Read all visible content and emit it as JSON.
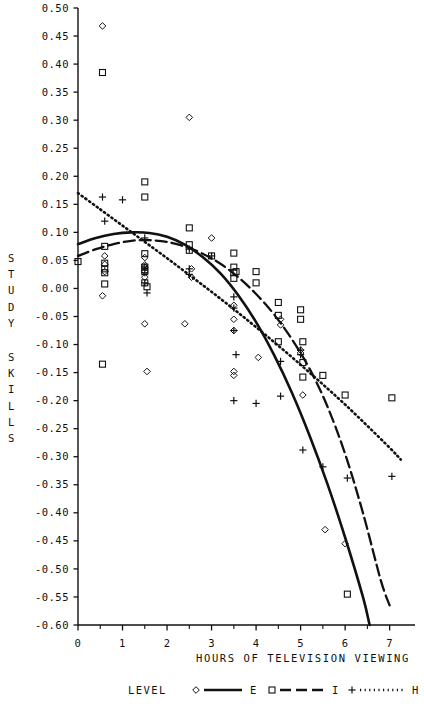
{
  "chart_data": {
    "type": "scatter",
    "title": "",
    "xlabel": "HOURS OF TELEVISION VIEWING",
    "ylabel": "STUDY SKILLS",
    "xlim": [
      0,
      7.3
    ],
    "ylim": [
      -0.6,
      0.5
    ],
    "grid": false,
    "xticks": [
      0,
      1,
      2,
      3,
      4,
      5,
      6,
      7
    ],
    "xtick_labels": [
      "0",
      "1",
      "2",
      "3",
      "4",
      "5",
      "6",
      "7"
    ],
    "xminor_step": 0.5,
    "yticks": [
      0.5,
      0.45,
      0.4,
      0.35,
      0.3,
      0.25,
      0.2,
      0.15,
      0.1,
      0.05,
      0.0,
      -0.05,
      -0.1,
      -0.15,
      -0.2,
      -0.25,
      -0.3,
      -0.35,
      -0.4,
      -0.45,
      -0.5,
      -0.55,
      -0.6
    ],
    "ytick_labels": [
      "0.50",
      "0.45",
      "0.40",
      "0.35",
      "0.30",
      "0.25",
      "0.20",
      "0.15",
      "0.10",
      "0.05",
      "0.00",
      "-0.05",
      "-0.10",
      "-0.15",
      "-0.20",
      "-0.25",
      "-0.30",
      "-0.35",
      "-0.40",
      "-0.45",
      "-0.50",
      "-0.55",
      "-0.60"
    ],
    "legend_title": "LEVEL",
    "legend_position": "bottom",
    "series": [
      {
        "name": "E",
        "marker": "diamond",
        "line": "solid",
        "points": [
          [
            0.55,
            0.468
          ],
          [
            0.55,
            -0.013
          ],
          [
            0.6,
            0.058
          ],
          [
            0.6,
            0.043
          ],
          [
            0.6,
            0.03
          ],
          [
            1.5,
            0.055
          ],
          [
            1.5,
            0.042
          ],
          [
            1.5,
            0.038
          ],
          [
            1.5,
            0.03
          ],
          [
            1.5,
            0.02
          ],
          [
            1.55,
            -0.148
          ],
          [
            2.5,
            0.305
          ],
          [
            2.55,
            0.035
          ],
          [
            2.55,
            0.02
          ],
          [
            3.0,
            0.09
          ],
          [
            3.5,
            -0.03
          ],
          [
            3.5,
            -0.055
          ],
          [
            3.5,
            -0.075
          ],
          [
            3.5,
            -0.148
          ],
          [
            3.5,
            -0.155
          ],
          [
            4.05,
            -0.123
          ],
          [
            4.55,
            -0.055
          ],
          [
            4.55,
            -0.065
          ],
          [
            5.0,
            -0.11
          ],
          [
            5.0,
            -0.115
          ],
          [
            5.05,
            -0.19
          ],
          [
            5.55,
            -0.43
          ],
          [
            6.0,
            -0.455
          ],
          [
            1.5,
            -0.063
          ],
          [
            2.4,
            -0.063
          ]
        ],
        "curve": [
          [
            0.0,
            0.079
          ],
          [
            0.4,
            0.09
          ],
          [
            0.8,
            0.097
          ],
          [
            1.2,
            0.1
          ],
          [
            1.6,
            0.099
          ],
          [
            2.0,
            0.092
          ],
          [
            2.4,
            0.078
          ],
          [
            2.8,
            0.056
          ],
          [
            3.2,
            0.027
          ],
          [
            3.6,
            -0.012
          ],
          [
            4.0,
            -0.06
          ],
          [
            4.4,
            -0.118
          ],
          [
            4.8,
            -0.185
          ],
          [
            5.2,
            -0.262
          ],
          [
            5.6,
            -0.348
          ],
          [
            6.0,
            -0.444
          ],
          [
            6.4,
            -0.55
          ],
          [
            6.55,
            -0.6
          ]
        ]
      },
      {
        "name": "I",
        "marker": "square",
        "line": "dashdot",
        "points": [
          [
            0.0,
            0.048
          ],
          [
            0.55,
            0.385
          ],
          [
            0.55,
            -0.135
          ],
          [
            0.6,
            0.045
          ],
          [
            0.6,
            0.035
          ],
          [
            0.6,
            0.028
          ],
          [
            0.6,
            0.008
          ],
          [
            0.6,
            0.075
          ],
          [
            1.5,
            0.19
          ],
          [
            1.5,
            0.163
          ],
          [
            1.5,
            0.062
          ],
          [
            1.5,
            0.038
          ],
          [
            1.5,
            0.03
          ],
          [
            1.5,
            0.01
          ],
          [
            1.55,
            0.003
          ],
          [
            2.5,
            0.108
          ],
          [
            2.5,
            0.078
          ],
          [
            2.5,
            0.068
          ],
          [
            3.0,
            0.058
          ],
          [
            3.5,
            0.063
          ],
          [
            3.5,
            0.038
          ],
          [
            3.5,
            0.028
          ],
          [
            3.5,
            0.018
          ],
          [
            3.55,
            0.03
          ],
          [
            4.0,
            0.03
          ],
          [
            4.0,
            0.01
          ],
          [
            4.5,
            -0.025
          ],
          [
            4.5,
            -0.048
          ],
          [
            4.5,
            -0.095
          ],
          [
            5.0,
            -0.038
          ],
          [
            5.0,
            -0.055
          ],
          [
            5.05,
            -0.095
          ],
          [
            5.05,
            -0.132
          ],
          [
            5.05,
            -0.158
          ],
          [
            5.5,
            -0.155
          ],
          [
            6.0,
            -0.19
          ],
          [
            6.05,
            -0.545
          ],
          [
            7.05,
            -0.195
          ]
        ],
        "curve": [
          [
            0.0,
            0.058
          ],
          [
            0.4,
            0.07
          ],
          [
            0.8,
            0.079
          ],
          [
            1.2,
            0.085
          ],
          [
            1.6,
            0.086
          ],
          [
            2.0,
            0.083
          ],
          [
            2.4,
            0.075
          ],
          [
            2.8,
            0.062
          ],
          [
            3.2,
            0.044
          ],
          [
            3.6,
            0.02
          ],
          [
            4.0,
            -0.01
          ],
          [
            4.4,
            -0.046
          ],
          [
            4.8,
            -0.09
          ],
          [
            5.2,
            -0.143
          ],
          [
            5.6,
            -0.21
          ],
          [
            6.0,
            -0.295
          ],
          [
            6.4,
            -0.4
          ],
          [
            6.8,
            -0.52
          ],
          [
            7.0,
            -0.565
          ]
        ]
      },
      {
        "name": "H",
        "marker": "plus",
        "line": "dotted",
        "points": [
          [
            0.55,
            0.163
          ],
          [
            0.6,
            0.12
          ],
          [
            1.0,
            0.158
          ],
          [
            1.5,
            0.09
          ],
          [
            1.5,
            0.038
          ],
          [
            1.5,
            0.028
          ],
          [
            1.5,
            0.01
          ],
          [
            1.55,
            -0.008
          ],
          [
            2.5,
            0.07
          ],
          [
            2.5,
            0.035
          ],
          [
            2.5,
            0.025
          ],
          [
            3.0,
            0.058
          ],
          [
            3.5,
            -0.015
          ],
          [
            3.5,
            -0.035
          ],
          [
            3.5,
            -0.075
          ],
          [
            3.55,
            -0.118
          ],
          [
            3.5,
            -0.2
          ],
          [
            4.0,
            -0.205
          ],
          [
            4.55,
            -0.13
          ],
          [
            4.55,
            -0.192
          ],
          [
            5.0,
            -0.11
          ],
          [
            5.0,
            -0.118
          ],
          [
            5.05,
            -0.288
          ],
          [
            5.5,
            -0.318
          ],
          [
            6.05,
            -0.338
          ],
          [
            7.05,
            -0.335
          ]
        ],
        "curve": [
          [
            0.0,
            0.17
          ],
          [
            0.5,
            0.141
          ],
          [
            1.0,
            0.112
          ],
          [
            1.5,
            0.083
          ],
          [
            2.0,
            0.054
          ],
          [
            2.5,
            0.024
          ],
          [
            3.0,
            -0.006
          ],
          [
            3.5,
            -0.037
          ],
          [
            4.0,
            -0.069
          ],
          [
            4.5,
            -0.102
          ],
          [
            5.0,
            -0.136
          ],
          [
            5.5,
            -0.171
          ],
          [
            6.0,
            -0.207
          ],
          [
            6.5,
            -0.245
          ],
          [
            7.0,
            -0.284
          ],
          [
            7.25,
            -0.305
          ]
        ]
      }
    ]
  },
  "axes": {
    "y_label_text": "STUDY SKILLS",
    "x_label_text": "HOURS OF TELEVISION VIEWING"
  },
  "legend": {
    "title": "LEVEL",
    "entries": [
      {
        "label": "E",
        "marker": "diamond",
        "line": "solid"
      },
      {
        "label": "I",
        "marker": "square",
        "line": "dashdot"
      },
      {
        "label": "H",
        "marker": "plus",
        "line": "dotted"
      }
    ]
  },
  "colors": {
    "foreground": "#111111",
    "background": "#ffffff"
  }
}
